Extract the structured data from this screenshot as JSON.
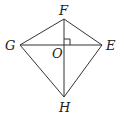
{
  "diagram": {
    "type": "kite-quadrilateral",
    "points": {
      "F": {
        "label": "F",
        "x": 64,
        "y": 19
      },
      "G": {
        "label": "G",
        "x": 20,
        "y": 45
      },
      "E": {
        "label": "E",
        "x": 102,
        "y": 45
      },
      "H": {
        "label": "H",
        "x": 64,
        "y": 97
      },
      "O": {
        "label": "O",
        "x": 64,
        "y": 45
      }
    },
    "segments": [
      "FG",
      "FE",
      "GH",
      "EH",
      "GE",
      "FH"
    ],
    "right_angle_at": "O",
    "stroke_color": "#333333"
  }
}
